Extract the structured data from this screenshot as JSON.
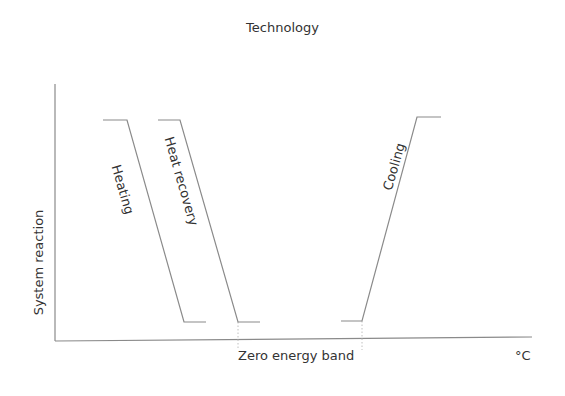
{
  "title": "Technology",
  "axes": {
    "y_label": "System reaction",
    "x_unit": "°C",
    "x_marker_label": "Zero energy band"
  },
  "curves": [
    {
      "name": "Heating",
      "direction": "decreasing"
    },
    {
      "name": "Heat recovery",
      "direction": "decreasing"
    },
    {
      "name": "Cooling",
      "direction": "increasing"
    }
  ],
  "colors": {
    "line": "#8a8a8a",
    "axis": "#8a8a8a",
    "dotted": "#c0c0c0",
    "text": "#333333"
  }
}
